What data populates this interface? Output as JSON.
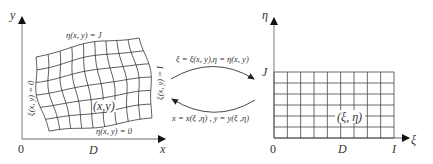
{
  "physical_domain": {
    "axis_x_label": "x",
    "axis_y_label": "y",
    "origin_label": "0",
    "x_extent_label": "D",
    "top_boundary": "η(x, y) = J",
    "bottom_boundary": "η(x, y) = 0",
    "left_boundary": "ξ(x, y) = 0",
    "right_boundary": "ξ(x, y) = I",
    "point_label": "(x,y)",
    "grid": {
      "columns": 9,
      "rows": 6,
      "line_color": "#333333"
    }
  },
  "mapping": {
    "forward": "ξ = ξ(x, y),η = η(x, y)",
    "inverse": "x = x(ξ ,η) ,  y = y(ξ ,η)",
    "arrow_color": "#333333"
  },
  "computational_domain": {
    "axis_xi_label": "ξ",
    "axis_eta_label": "η",
    "origin_label": "0",
    "mid_label": "D",
    "xi_max_label": "I",
    "eta_max_label": "J",
    "point_label": "(ξ, η)",
    "grid": {
      "columns": 9,
      "rows": 6,
      "line_color": "#333333"
    }
  },
  "colors": {
    "axis": "#999999",
    "arrowhead": "#111111",
    "text": "#333333",
    "background": "#ffffff"
  }
}
